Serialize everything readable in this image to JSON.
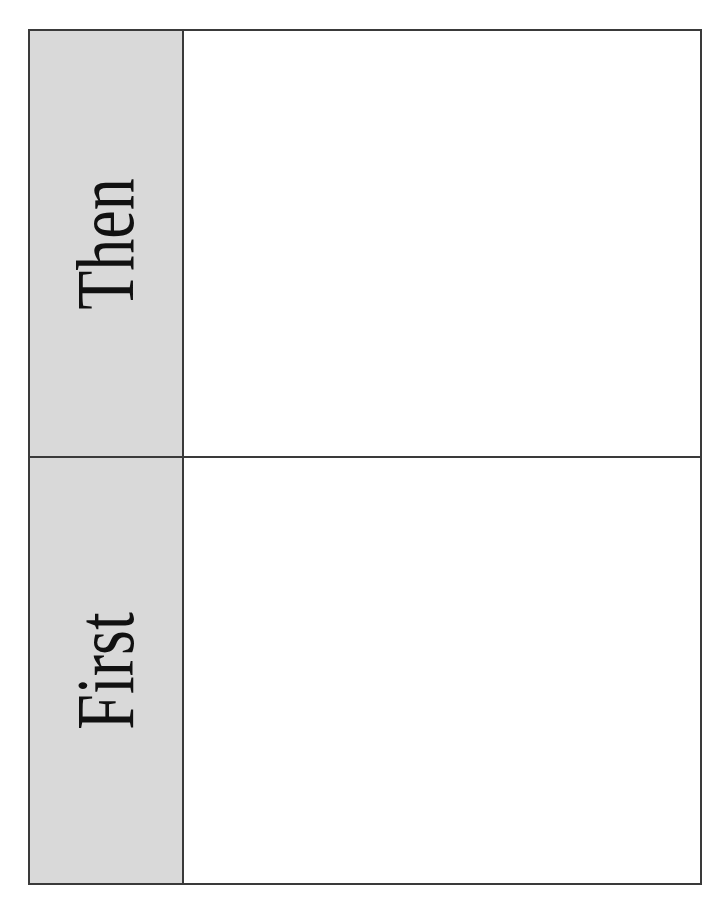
{
  "document": {
    "kind": "first-then-board",
    "panels": [
      {
        "id": "then",
        "label": "Then"
      },
      {
        "id": "first",
        "label": "First"
      }
    ]
  },
  "colors": {
    "page-background": "#ffffff",
    "label-background": "#d9d9d9",
    "border": "#3a3a3a",
    "text": "#111111"
  }
}
